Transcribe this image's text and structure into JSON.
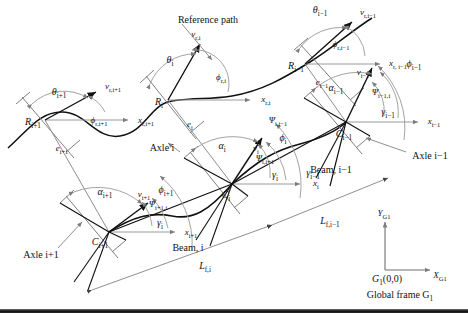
{
  "figure": {
    "colors": {
      "curve": "#111111",
      "thin_line": "#8a8a8a",
      "arc": "#9a9a9a",
      "vector": "#111111",
      "text": "#111111",
      "background": "#ffffff",
      "baseline": "#1a1a1a"
    }
  },
  "annotations": {
    "reference_path": "Reference path",
    "axle_i": "Axle i",
    "axle_i_minus_1": "Axle i−1",
    "axle_i_plus_1": "Axle i+1",
    "beam_i": "Beam, i",
    "beam_i_minus_1": "Beam, i−1",
    "global_frame": "Global frame G",
    "global_frame_sub": "1",
    "global_origin": "G",
    "global_origin_sub": "1",
    "global_origin_coords": "(0,0)",
    "axis_x_global": "X",
    "axis_x_global_sub": "G1",
    "axis_y_global": "Y",
    "axis_y_global_sub": "G1"
  },
  "points": {
    "R_i": {
      "sym": "R",
      "sub": "i"
    },
    "R_i_minus_1": {
      "sym": "R",
      "sub": "i−1"
    },
    "R_i_plus_1": {
      "sym": "R",
      "sub": "i+1"
    },
    "C_i": {
      "sym": "C",
      "sub": "i"
    },
    "C_i_minus_1": {
      "sym": "C",
      "sub": "i−1"
    },
    "C_i_plus_1": {
      "sym": "C",
      "sub": "i+1"
    }
  },
  "velocities": {
    "v_r_i": {
      "sym": "v",
      "sub": "r,i"
    },
    "v_r_i_minus_1": {
      "sym": "v",
      "sub": "r,i−1"
    },
    "v_r_i_plus_1": {
      "sym": "v",
      "sub": "r,i+1"
    },
    "v_i": {
      "sym": "v",
      "sub": "i"
    },
    "v_i_minus_1": {
      "sym": "v",
      "sub": "i−1"
    },
    "v_i_plus_1": {
      "sym": "v",
      "sub": "i+1"
    }
  },
  "errors": {
    "e_i": {
      "sym": "e",
      "sub": "i"
    },
    "e_i_minus_1": {
      "sym": "e",
      "sub": "i−1"
    },
    "e_i_plus_1": {
      "sym": "e",
      "sub": "i+1"
    }
  },
  "angles": {
    "theta_i": {
      "sym": "θ",
      "sub": "i"
    },
    "theta_i_minus_1": {
      "sym": "θ",
      "sub": "i−1"
    },
    "theta_i_plus_1": {
      "sym": "θ",
      "sub": "i+1"
    },
    "phi_r_i": {
      "sym": "ϕ",
      "sub": "r,i"
    },
    "phi_r_i_minus_1": {
      "sym": "ϕ",
      "sub": "r,i−1"
    },
    "phi_r_i_plus_1": {
      "sym": "ϕ",
      "sub": "r,i+1"
    },
    "phi_i": {
      "sym": "ϕ",
      "sub": "i"
    },
    "phi_i_minus_1": {
      "sym": "ϕ",
      "sub": "i−1"
    },
    "phi_i_plus_1": {
      "sym": "ϕ",
      "sub": "i+1"
    },
    "alpha_i": {
      "sym": "α",
      "sub": "i"
    },
    "alpha_i_minus_1": {
      "sym": "α",
      "sub": "i−1"
    },
    "alpha_i_plus_1": {
      "sym": "α",
      "sub": "i+1"
    },
    "psi_i_i_minus_1": {
      "sym": "Ψ",
      "sub": "i,i−1"
    },
    "psi_i_i_plus_1": {
      "sym": "Ψ",
      "sub": "i,i+1"
    },
    "psi_i_minus_1_i": {
      "sym": "Ψ",
      "sub": "i−1,i"
    },
    "psi_i_plus_1_i": {
      "sym": "Ψ",
      "sub": "i+1,i"
    },
    "gamma_i": {
      "sym": "γ",
      "sub": "i"
    },
    "gamma_i_minus_1": {
      "sym": "γ",
      "sub": "i−1"
    }
  },
  "axes": {
    "x_r_i": {
      "sym": "x",
      "sub": "r,i"
    },
    "x_r_i_minus_1": {
      "sym": "x",
      "sub": "r, i−1"
    },
    "x_r_i_plus_1": {
      "sym": "x",
      "sub": "r,i+1"
    },
    "x_i": {
      "sym": "x",
      "sub": "i"
    },
    "x_i_minus_1": {
      "sym": "x",
      "sub": "i−1"
    },
    "x_i_plus_1": {
      "sym": "x",
      "sub": "i+1"
    }
  },
  "lengths": {
    "L_f_i": {
      "sym": "L",
      "sub": "f,i"
    },
    "L_f_i_minus_1": {
      "sym": "L",
      "sub": "f,i−1"
    }
  }
}
